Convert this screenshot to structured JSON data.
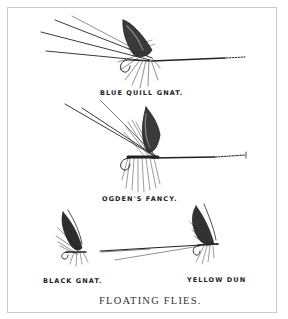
{
  "plate": {
    "title": "FLOATING FLIES.",
    "flies": [
      {
        "name": "BLUE QUILL GNAT."
      },
      {
        "name": "OGDEN'S FANCY."
      },
      {
        "name": "BLACK GNAT."
      },
      {
        "name": "YELLOW DUN"
      }
    ]
  },
  "colors": {
    "ink": "#222222",
    "frame": "#c9c9c9",
    "paper": "#ffffff"
  }
}
